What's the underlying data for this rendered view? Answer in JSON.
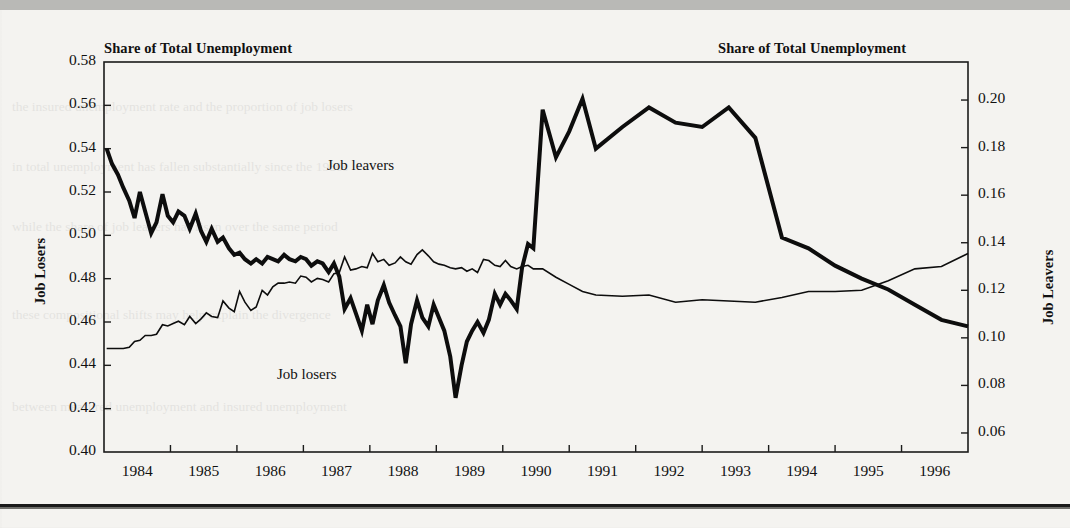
{
  "figure": {
    "left_axis_title": "Share of Total Unemployment",
    "right_axis_title": "Share of Total Unemployment",
    "left_axis_label": "Job Losers",
    "right_axis_label": "Job Leavers",
    "annotation_leavers": "Job leavers",
    "annotation_losers": "Job losers"
  },
  "chart_data": {
    "type": "line",
    "title": "Share of Total Unemployment",
    "subtitle": "",
    "xlabel": "",
    "ylabel": "Job Losers",
    "y2label": "Job Leavers",
    "grid": false,
    "legend": "inline-annotations",
    "xlim": [
      1983.5,
      1996.5
    ],
    "ylim": [
      0.4,
      0.58
    ],
    "y2lim": [
      0.052,
      0.216
    ],
    "ytick_labels": [
      "0.40",
      "0.42",
      "0.44",
      "0.46",
      "0.48",
      "0.50",
      "0.52",
      "0.54",
      "0.56",
      "0.58"
    ],
    "ytick_values": [
      0.4,
      0.42,
      0.44,
      0.46,
      0.48,
      0.5,
      0.52,
      0.54,
      0.56,
      0.58
    ],
    "y2tick_labels": [
      "0.06",
      "0.08",
      "0.10",
      "0.12",
      "0.14",
      "0.16",
      "0.18",
      "0.20"
    ],
    "y2tick_values": [
      0.06,
      0.08,
      0.1,
      0.12,
      0.14,
      0.16,
      0.18,
      0.2
    ],
    "xtick_labels": [
      "1984",
      "1985",
      "1986",
      "1987",
      "1988",
      "1989",
      "1990",
      "1991",
      "1992",
      "1993",
      "1994",
      "1995",
      "1996"
    ],
    "xtick_values": [
      1984,
      1985,
      1986,
      1987,
      1988,
      1989,
      1990,
      1991,
      1992,
      1993,
      1994,
      1995,
      1996
    ],
    "series": [
      {
        "name": "Job losers",
        "axis": "left",
        "style": "thick-black",
        "linewidth": 4,
        "x": [
          1983.54,
          1983.62,
          1983.71,
          1983.79,
          1983.88,
          1983.96,
          1984.04,
          1984.12,
          1984.21,
          1984.29,
          1984.38,
          1984.46,
          1984.54,
          1984.62,
          1984.71,
          1984.79,
          1984.88,
          1984.96,
          1985.04,
          1985.12,
          1985.21,
          1985.29,
          1985.38,
          1985.46,
          1985.54,
          1985.62,
          1985.71,
          1985.79,
          1985.88,
          1985.96,
          1986.04,
          1986.12,
          1986.21,
          1986.29,
          1986.38,
          1986.46,
          1986.54,
          1986.62,
          1986.71,
          1986.79,
          1986.88,
          1986.96,
          1987.04,
          1987.12,
          1987.21,
          1987.29,
          1987.38,
          1987.46,
          1987.54,
          1987.62,
          1987.71,
          1987.79,
          1987.88,
          1987.96,
          1988.04,
          1988.12,
          1988.21,
          1988.29,
          1988.38,
          1988.46,
          1988.54,
          1988.62,
          1988.71,
          1988.79,
          1988.88,
          1988.96,
          1989.04,
          1989.12,
          1989.21,
          1989.29,
          1989.38,
          1989.46,
          1989.54,
          1989.62,
          1989.71,
          1989.79,
          1989.88,
          1989.96,
          1990.1,
          1990.3,
          1990.5,
          1990.7,
          1990.9,
          1991.3,
          1991.7,
          1992.1,
          1992.5,
          1992.9,
          1993.3,
          1993.7,
          1994.1,
          1994.5,
          1994.9,
          1995.3,
          1995.7,
          1996.1,
          1996.5
        ],
        "y": [
          0.54,
          0.533,
          0.528,
          0.522,
          0.516,
          0.508,
          0.52,
          0.511,
          0.501,
          0.506,
          0.519,
          0.509,
          0.506,
          0.511,
          0.509,
          0.503,
          0.51,
          0.502,
          0.497,
          0.503,
          0.497,
          0.499,
          0.494,
          0.491,
          0.492,
          0.489,
          0.487,
          0.489,
          0.487,
          0.49,
          0.489,
          0.488,
          0.491,
          0.489,
          0.488,
          0.49,
          0.489,
          0.486,
          0.488,
          0.487,
          0.483,
          0.487,
          0.481,
          0.466,
          0.471,
          0.464,
          0.456,
          0.468,
          0.459,
          0.47,
          0.477,
          0.469,
          0.463,
          0.458,
          0.441,
          0.459,
          0.47,
          0.462,
          0.458,
          0.468,
          0.462,
          0.456,
          0.444,
          0.425,
          0.44,
          0.451,
          0.456,
          0.46,
          0.455,
          0.461,
          0.473,
          0.468,
          0.473,
          0.47,
          0.466,
          0.485,
          0.496,
          0.494,
          0.558,
          0.536,
          0.548,
          0.563,
          0.54,
          0.55,
          0.559,
          0.552,
          0.55,
          0.559,
          0.545,
          0.499,
          0.494,
          0.486,
          0.48,
          0.475,
          0.468,
          0.461,
          0.458
        ]
      },
      {
        "name": "Job leavers",
        "axis": "right",
        "style": "thin-black",
        "linewidth": 1.6,
        "x": [
          1983.54,
          1983.62,
          1983.71,
          1983.79,
          1983.88,
          1983.96,
          1984.04,
          1984.12,
          1984.21,
          1984.29,
          1984.38,
          1984.46,
          1984.54,
          1984.62,
          1984.71,
          1984.79,
          1984.88,
          1984.96,
          1985.04,
          1985.12,
          1985.21,
          1985.29,
          1985.38,
          1985.46,
          1985.54,
          1985.62,
          1985.71,
          1985.79,
          1985.88,
          1985.96,
          1986.04,
          1986.12,
          1986.21,
          1986.29,
          1986.38,
          1986.46,
          1986.54,
          1986.62,
          1986.71,
          1986.79,
          1986.88,
          1986.96,
          1987.04,
          1987.12,
          1987.21,
          1987.29,
          1987.38,
          1987.46,
          1987.54,
          1987.62,
          1987.71,
          1987.79,
          1987.88,
          1987.96,
          1988.04,
          1988.12,
          1988.21,
          1988.29,
          1988.38,
          1988.46,
          1988.54,
          1988.62,
          1988.71,
          1988.79,
          1988.88,
          1988.96,
          1989.04,
          1989.12,
          1989.21,
          1989.29,
          1989.38,
          1989.46,
          1989.54,
          1989.62,
          1989.71,
          1989.79,
          1989.88,
          1989.96,
          1990.1,
          1990.3,
          1990.5,
          1990.7,
          1990.9,
          1991.3,
          1991.7,
          1992.1,
          1992.5,
          1992.9,
          1993.3,
          1993.7,
          1994.1,
          1994.5,
          1994.9,
          1995.3,
          1995.7,
          1996.1,
          1996.5
        ],
        "y": [
          0.0955,
          0.0955,
          0.0955,
          0.0955,
          0.096,
          0.0985,
          0.099,
          0.101,
          0.101,
          0.1015,
          0.1055,
          0.105,
          0.106,
          0.107,
          0.1055,
          0.109,
          0.106,
          0.108,
          0.1105,
          0.109,
          0.1085,
          0.1155,
          0.1125,
          0.111,
          0.1195,
          0.115,
          0.1115,
          0.113,
          0.12,
          0.118,
          0.1215,
          0.123,
          0.123,
          0.1235,
          0.123,
          0.126,
          0.1255,
          0.1235,
          0.125,
          0.1245,
          0.1235,
          0.127,
          0.1275,
          0.134,
          0.1285,
          0.129,
          0.13,
          0.1295,
          0.1355,
          0.132,
          0.133,
          0.1305,
          0.1315,
          0.134,
          0.132,
          0.131,
          0.135,
          0.137,
          0.1345,
          0.132,
          0.131,
          0.1305,
          0.1295,
          0.129,
          0.1295,
          0.128,
          0.129,
          0.1275,
          0.133,
          0.1325,
          0.1305,
          0.13,
          0.1325,
          0.13,
          0.129,
          0.13,
          0.1305,
          0.129,
          0.129,
          0.1255,
          0.1225,
          0.1195,
          0.118,
          0.1175,
          0.118,
          0.115,
          0.116,
          0.1155,
          0.115,
          0.117,
          0.1195,
          0.1195,
          0.12,
          0.124,
          0.129,
          0.13,
          0.1355
        ]
      }
    ]
  },
  "ghost_text": {
    "lines": [
      "the insured unemployment rate and the proportion of job losers",
      "in total unemployment has fallen substantially since the 1980s",
      "while the share of job leavers has risen over the same period",
      "these compositional shifts may help explain the divergence",
      "between measured unemployment and insured unemployment"
    ]
  }
}
